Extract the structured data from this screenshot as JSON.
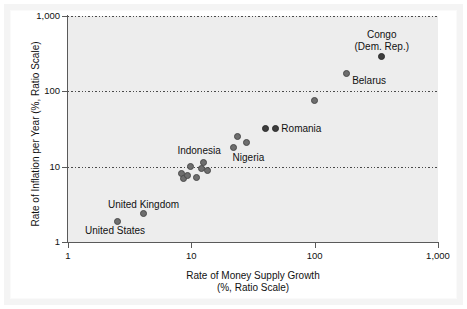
{
  "chart_data": {
    "type": "scatter",
    "title": "",
    "xlabel": "Rate of Money Supply Growth\n(%, Ratio Scale)",
    "xlabel_line1": "Rate of Money Supply Growth",
    "xlabel_line2": "(%, Ratio Scale)",
    "ylabel": "Rate of Inflation per Year (%, Ratio Scale)",
    "xscale": "log",
    "yscale": "log",
    "xlim": [
      1,
      1000
    ],
    "ylim": [
      1,
      1000
    ],
    "grid": "horizontal-dotted",
    "legend": "none",
    "xticks": [
      1,
      10,
      100,
      1000
    ],
    "xtick_labels": [
      "1",
      "10",
      "100",
      "1,000"
    ],
    "yticks": [
      1,
      10,
      100,
      1000
    ],
    "ytick_labels": [
      "1",
      "10",
      "100",
      "1,000"
    ],
    "points": [
      {
        "label": "United States",
        "x": 2.5,
        "y": 1.9,
        "label_pos": "below-left"
      },
      {
        "label": "United Kingdom",
        "x": 4.1,
        "y": 2.4,
        "label_pos": "above"
      },
      {
        "label": "",
        "x": 8.3,
        "y": 8.2,
        "label_pos": ""
      },
      {
        "label": "",
        "x": 8.6,
        "y": 6.9,
        "label_pos": ""
      },
      {
        "label": "",
        "x": 9.3,
        "y": 7.6,
        "label_pos": ""
      },
      {
        "label": "",
        "x": 9.9,
        "y": 10.0,
        "label_pos": ""
      },
      {
        "label": "",
        "x": 11.0,
        "y": 7.1,
        "label_pos": ""
      },
      {
        "label": "Indonesia",
        "x": 12.0,
        "y": 9.5,
        "label_pos": "above-left"
      },
      {
        "label": "",
        "x": 12.6,
        "y": 11.2,
        "label_pos": ""
      },
      {
        "label": "",
        "x": 13.5,
        "y": 9.0,
        "label_pos": ""
      },
      {
        "label": "Nigeria",
        "x": 22.0,
        "y": 18.0,
        "label_pos": "below"
      },
      {
        "label": "",
        "x": 23.5,
        "y": 25.0,
        "label_pos": ""
      },
      {
        "label": "",
        "x": 28.0,
        "y": 21.0,
        "label_pos": ""
      },
      {
        "label": "",
        "x": 40.0,
        "y": 32.0,
        "label_pos": ""
      },
      {
        "label": "Romania",
        "x": 48.0,
        "y": 32.0,
        "label_pos": "right"
      },
      {
        "label": "",
        "x": 100.0,
        "y": 75.0,
        "label_pos": ""
      },
      {
        "label": "Belarus",
        "x": 180.0,
        "y": 170.0,
        "label_pos": "right"
      },
      {
        "label": "Congo\n(Dem. Rep.)",
        "x": 350.0,
        "y": 290.0,
        "label_pos": "above"
      }
    ],
    "annotations": [
      {
        "name": "congo-label",
        "text_line1": "Congo",
        "text_line2": "(Dem. Rep.)"
      },
      {
        "name": "belarus-label",
        "text": "Belarus"
      },
      {
        "name": "romania-label",
        "text": "Romania"
      },
      {
        "name": "nigeria-label",
        "text": "Nigeria"
      },
      {
        "name": "indonesia-label",
        "text": "Indonesia"
      },
      {
        "name": "united-kingdom-label",
        "text": "United Kingdom"
      },
      {
        "name": "united-states-label",
        "text": "United States"
      }
    ],
    "colors": {
      "plot_background": "#ededed",
      "marker": "#6e6e6e",
      "marker_dark": "#3d3d3d",
      "axis": "#5a5a5a",
      "gridline": "#4a4a4a",
      "text": "#111111",
      "page_background": "#ffffff"
    }
  },
  "axes": {
    "y": {
      "title": "Rate of Inflation per Year (%, Ratio Scale)",
      "ticks": [
        "1,000",
        "100",
        "10",
        "1"
      ]
    },
    "x": {
      "title_line1": "Rate of Money Supply Growth",
      "title_line2": "(%, Ratio Scale)",
      "ticks": [
        "1",
        "10",
        "100",
        "1,000"
      ]
    }
  },
  "labels": {
    "congo_line1": "Congo",
    "congo_line2": "(Dem. Rep.)",
    "belarus": "Belarus",
    "romania": "Romania",
    "nigeria": "Nigeria",
    "indonesia": "Indonesia",
    "united_kingdom": "United Kingdom",
    "united_states": "United States"
  }
}
